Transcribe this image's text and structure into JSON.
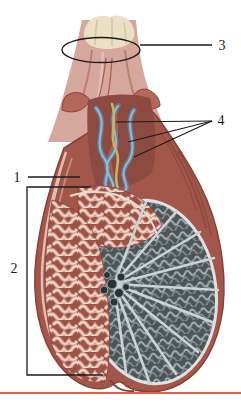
{
  "figure": {
    "type": "anatomical-diagram",
    "labels": [
      {
        "id": "1",
        "text": "1"
      },
      {
        "id": "2",
        "text": "2"
      },
      {
        "id": "3",
        "text": "3"
      },
      {
        "id": "4",
        "text": "4"
      }
    ],
    "colors": {
      "background": "#ffffff",
      "line": "#1c1c1c",
      "bottom_rule": "#e0614a",
      "cord_skin": "#d6a79c",
      "cord_cut_end": "#ebdfc6",
      "fascia_flap": "#b4685a",
      "opening_dark": "#8d4a40",
      "vein_blue": "#5d7f9b",
      "vein_highlight": "#9db8c9",
      "duct_yellow": "#c9b35f",
      "artery_red": "#c4593f",
      "sac_brown": "#a2574a",
      "sac_outline": "#8a4035",
      "layer_pink": "#e2bdb0",
      "epididymis_base": "#9a5345",
      "epididymis_coil": "#d9a596",
      "coil_core": "#f3e3da",
      "lobule_gray": "#4d5456",
      "tubule_gray": "#a9b5b9",
      "septa_light": "#ccd3d6",
      "rim_white": "#dde2e4",
      "mediastinum_dark": "#2c3335"
    }
  }
}
